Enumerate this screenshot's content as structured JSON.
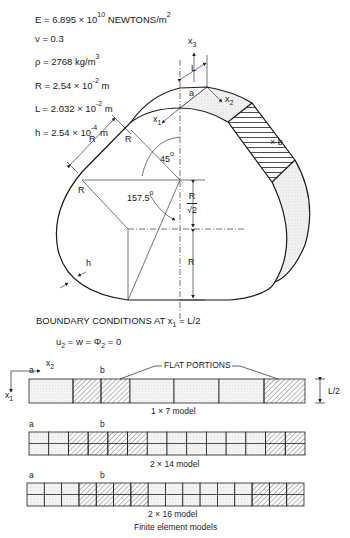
{
  "parameters": [
    {
      "symbol": "E",
      "value": "6.895 × 10",
      "exp": "10",
      "unit": "NEWTONS/m",
      "unit_exp": "2"
    },
    {
      "symbol": "ν",
      "value": "0.3",
      "exp": "",
      "unit": "",
      "unit_exp": ""
    },
    {
      "symbol": "ρ",
      "value": "2768 kg/m",
      "exp": "",
      "unit": "",
      "unit_exp": "3"
    },
    {
      "symbol": "R",
      "value": "2.54 × 10",
      "exp": "-2",
      "unit": "m",
      "unit_exp": ""
    },
    {
      "symbol": "L",
      "value": "2.032 × 10",
      "exp": "-2",
      "unit": "m",
      "unit_exp": ""
    },
    {
      "symbol": "h",
      "value": "2.54 × 10",
      "exp": "-4",
      "unit": "m",
      "unit_exp": ""
    }
  ],
  "shell_diagram": {
    "axis_labels": {
      "x1": "x",
      "x1_sub": "1",
      "x2": "x",
      "x2_sub": "2",
      "x3": "x",
      "x3_sub": "3"
    },
    "dim_L": "L",
    "point_a": "a",
    "point_b": "b",
    "dim_R_labels": [
      "R",
      "R",
      "R",
      "R"
    ],
    "angle_45": "45",
    "angle_157": "157.5",
    "angle_unit": "o",
    "ratio_num": "R",
    "ratio_den": "√2",
    "thickness": "h"
  },
  "boundary_conditions": {
    "title_prefix": "BOUNDARY CONDITIONS AT x",
    "title_sub": "1",
    "title_suffix": " = L/2",
    "eq_u": "u",
    "eq_u_sub": "2",
    "eq_mid": " = w = Φ",
    "eq_phi_sub": "2",
    "eq_end": " = 0"
  },
  "models": {
    "flat_portions_label": "FLAT PORTIONS",
    "dim_label": "L/2",
    "axis_x1": "x",
    "axis_x1_sub": "1",
    "axis_x2": "x",
    "axis_x2_sub": "2",
    "point_a": "a",
    "point_b": "b",
    "items": [
      {
        "name": "1 × 7  model",
        "rows": 1,
        "cols": 7,
        "hatched": [
          2,
          3,
          7
        ]
      },
      {
        "name": "2 × 14  model",
        "rows": 2,
        "cols": 14,
        "hatched": [
          3,
          4,
          5,
          6,
          13,
          14
        ]
      },
      {
        "name": "2 × 16  model",
        "rows": 2,
        "cols": 16,
        "hatched": [
          4,
          5,
          6,
          7,
          14,
          15,
          16
        ]
      }
    ],
    "caption": "Finite element models"
  }
}
